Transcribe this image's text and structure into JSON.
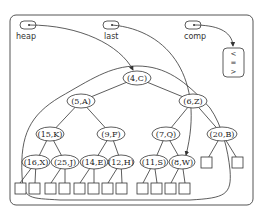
{
  "pointers": [
    {
      "label": "heap"
    },
    {
      "label": "last"
    },
    {
      "label": "comp"
    }
  ],
  "comparator": {
    "symbols": [
      "<",
      "=",
      ">"
    ]
  },
  "nodes": {
    "n0": "(4,C)",
    "n1": "(5,A)",
    "n2": "(6,Z)",
    "n3": "(15,K)",
    "n4": "(9,F)",
    "n5": "(7,Q)",
    "n6": "(20,B)",
    "n7": "(16,X)",
    "n8": "(25,J)",
    "n9": "(14,E)",
    "n10": "(12,H)",
    "n11": "(11,S)",
    "n12": "(8,W)"
  },
  "colors": {
    "stroke": "#333333",
    "background": "#ffffff"
  }
}
